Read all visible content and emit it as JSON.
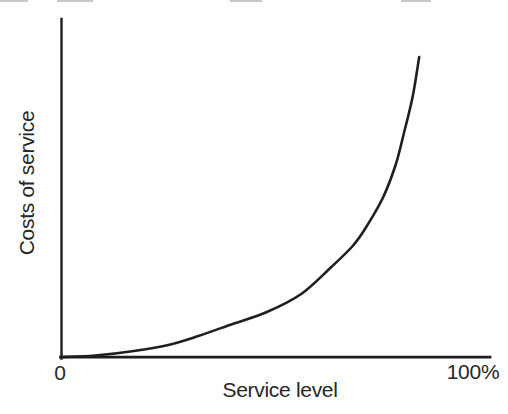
{
  "figure": {
    "background": "#ffffff",
    "line_color": "#1f1f1f",
    "text_color": "#262626",
    "artifact_color": "#b9b9b9"
  },
  "chart_data": {
    "type": "line",
    "title": "",
    "xlabel": "Service level",
    "ylabel": "Costs of service",
    "x_tick_labels": [
      "0",
      "100%"
    ],
    "x_range_pct": [
      0,
      100
    ],
    "y_range": [
      0,
      100
    ],
    "grid": false,
    "legend": false,
    "series": [
      {
        "name": "cost-of-service-curve",
        "color": "#1f1f1f",
        "points": [
          [
            0,
            0
          ],
          [
            8,
            0.5
          ],
          [
            17,
            2
          ],
          [
            25,
            4
          ],
          [
            32,
            7
          ],
          [
            40,
            11
          ],
          [
            48,
            15
          ],
          [
            56,
            21
          ],
          [
            63,
            30
          ],
          [
            68,
            37
          ],
          [
            71,
            43
          ],
          [
            75,
            53
          ],
          [
            78,
            64
          ],
          [
            80,
            75
          ],
          [
            82,
            87
          ],
          [
            83.5,
            100
          ]
        ]
      }
    ]
  }
}
